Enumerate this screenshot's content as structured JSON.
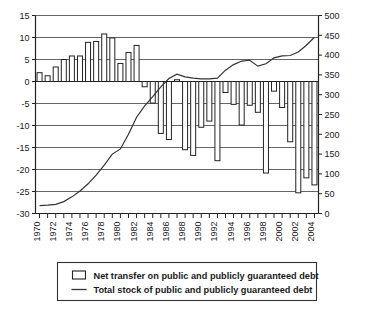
{
  "chart_data": {
    "type": "bar",
    "title": "",
    "subtitle": "",
    "xlabel": "",
    "ylabel": "",
    "y2label": "",
    "grid": true,
    "legend_position": "bottom",
    "x": [
      1970,
      1971,
      1972,
      1973,
      1974,
      1975,
      1976,
      1977,
      1978,
      1979,
      1980,
      1981,
      1982,
      1983,
      1984,
      1985,
      1986,
      1987,
      1988,
      1989,
      1990,
      1991,
      1992,
      1993,
      1994,
      1995,
      1996,
      1997,
      1998,
      1999,
      2000,
      2001,
      2002,
      2003,
      2004
    ],
    "xtick_labels": [
      "1970",
      "1972",
      "1974",
      "1976",
      "1978",
      "1980",
      "1982",
      "1984",
      "1986",
      "1988",
      "1990",
      "1992",
      "1994",
      "1996",
      "1998",
      "2000",
      "2002",
      "2004"
    ],
    "xtick_values": [
      1970,
      1972,
      1974,
      1976,
      1978,
      1980,
      1982,
      1984,
      1986,
      1988,
      1990,
      1992,
      1994,
      1996,
      1998,
      2000,
      2002,
      2004
    ],
    "ylim": [
      -30,
      15
    ],
    "yticks": [
      15,
      10,
      5,
      0,
      -5,
      -10,
      -15,
      -20,
      -25,
      -30
    ],
    "ytick_labels": [
      "15",
      "10",
      "5",
      "0",
      "-5",
      "-10",
      "-15",
      "-20",
      "-25",
      "-30"
    ],
    "y2lim": [
      0,
      500
    ],
    "y2ticks": [
      500,
      450,
      400,
      350,
      300,
      250,
      200,
      150,
      100,
      50,
      0
    ],
    "y2tick_labels": [
      "500",
      "450",
      "400",
      "350",
      "300",
      "250",
      "200",
      "150",
      "100",
      "50",
      "0"
    ],
    "series": [
      {
        "name": "Net transfer on public and publicly guaranteed debt",
        "type": "bar",
        "axis": "left",
        "values": [
          2.0,
          1.3,
          3.3,
          5.0,
          5.8,
          5.8,
          8.9,
          9.1,
          10.8,
          9.9,
          4.1,
          6.6,
          8.2,
          -1.2,
          -4.9,
          -11.8,
          -13.2,
          0.4,
          -15.5,
          -16.8,
          -10.4,
          -9.0,
          -18.0,
          -2.5,
          -5.2,
          -9.9,
          -5.4,
          -7.0,
          -20.8,
          -2.2,
          -5.9,
          -13.7,
          -25.3,
          -21.9,
          -23.5
        ]
      },
      {
        "name": "Total stock of public and publicly guaranteed debt",
        "type": "line",
        "axis": "right",
        "values": [
          20,
          21,
          23,
          30,
          42,
          57,
          75,
          97,
          122,
          150,
          163,
          200,
          243,
          272,
          295,
          320,
          341,
          352,
          345,
          342,
          340,
          340,
          342,
          362,
          376,
          385,
          387,
          372,
          378,
          393,
          398,
          399,
          408,
          425,
          445
        ]
      }
    ],
    "legend": [
      {
        "label": "Net transfer on public and publicly guaranteed debt",
        "marker": "square-outline"
      },
      {
        "label": "Total stock of public and publicly guaranteed debt",
        "marker": "line"
      }
    ]
  }
}
